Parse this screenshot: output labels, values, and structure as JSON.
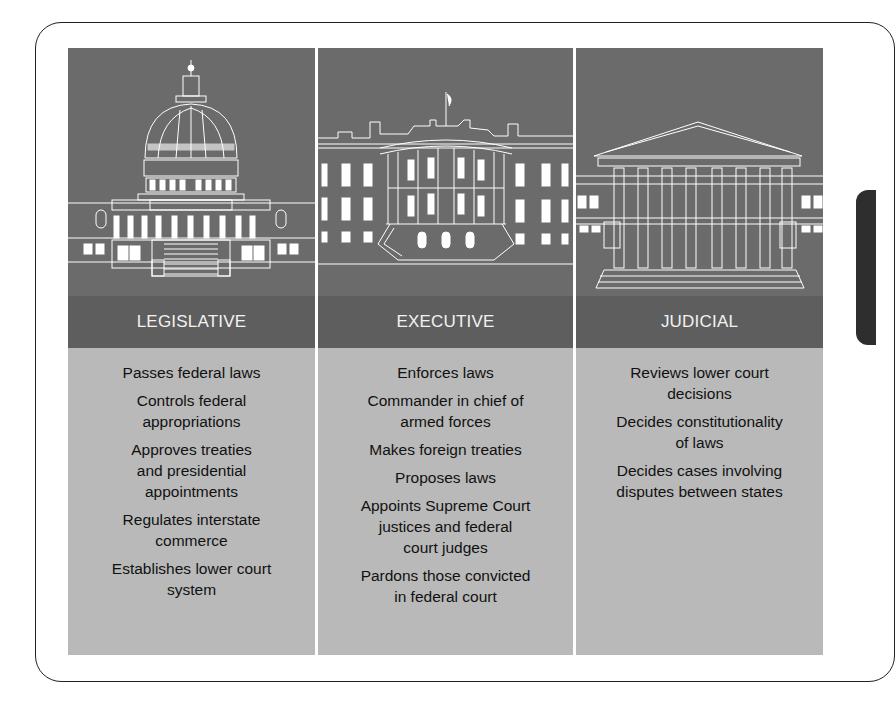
{
  "diagram": {
    "branches": [
      {
        "name": "LEGISLATIVE",
        "illustration": "capitol-building",
        "powers": [
          "Passes federal laws",
          "Controls federal\nappropriations",
          "Approves treaties\nand presidential\nappointments",
          "Regulates interstate\ncommerce",
          "Establishes lower court\nsystem"
        ]
      },
      {
        "name": "EXECUTIVE",
        "illustration": "white-house",
        "powers": [
          "Enforces laws",
          "Commander in chief of\narmed forces",
          "Makes foreign treaties",
          "Proposes laws",
          "Appoints Supreme Court\njustices and federal\ncourt judges",
          "Pardons those convicted\nin federal court"
        ]
      },
      {
        "name": "JUDICIAL",
        "illustration": "supreme-court-building",
        "powers": [
          "Reviews lower court\ndecisions",
          "Decides constitutionality\nof laws",
          "Decides cases involving\ndisputes between states"
        ]
      }
    ],
    "colors": {
      "illustration_bg": "#6b6b6b",
      "header_bg": "#5e5e5e",
      "body_bg": "#b9b9b9",
      "line_art": "#ffffff"
    }
  }
}
